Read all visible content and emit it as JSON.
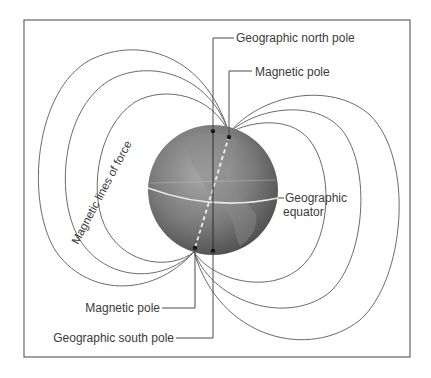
{
  "labels": {
    "geographic_north_pole": "Geographic north pole",
    "magnetic_pole_north": "Magnetic pole",
    "geographic_equator_line1": "Geographic",
    "geographic_equator_line2": "equator",
    "magnetic_lines_of_force": "Magnetic lines of force",
    "magnetic_pole_south": "Magnetic pole",
    "geographic_south_pole": "Geographic south pole"
  },
  "colors": {
    "globe_dark": "#4a4a4a",
    "globe_light": "#9a9a9a",
    "lines": "#6a6a6a",
    "text": "#3a3a3a",
    "equator": "#e8e8e8"
  }
}
